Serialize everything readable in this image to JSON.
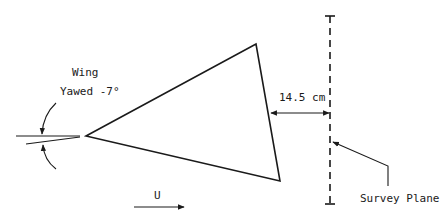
{
  "labels": {
    "wing": "Wing",
    "yaw": "Yawed -7°",
    "distance": "14.5 cm",
    "flow": "U",
    "survey_plane": "Survey Plane"
  },
  "geometry": {
    "triangle": {
      "apex_left": [
        86,
        136
      ],
      "top": [
        256,
        44
      ],
      "bottom": [
        280,
        181
      ]
    },
    "survey_plane_x": 330,
    "survey_plane_y": [
      15,
      205
    ]
  },
  "colors": {
    "line": "#1a1a1a",
    "background": "#ffffff"
  }
}
